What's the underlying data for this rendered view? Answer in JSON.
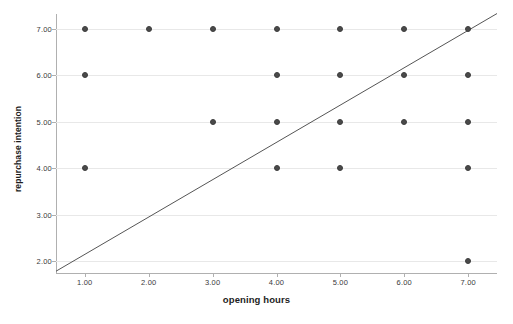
{
  "chart_data": {
    "type": "scatter",
    "title": "",
    "xlabel": "opening hours",
    "ylabel": "repurchase intention",
    "xlim": [
      0.55,
      7.45
    ],
    "ylim": [
      1.72,
      7.32
    ],
    "xticks": [
      1,
      2,
      3,
      4,
      5,
      6,
      7
    ],
    "xtick_labels": [
      "1.00",
      "2.00",
      "3.00",
      "4.00",
      "5.00",
      "6.00",
      "7.00"
    ],
    "yticks": [
      2,
      3,
      4,
      5,
      6,
      7
    ],
    "ytick_labels": [
      "2.00",
      "3.00",
      "4.00",
      "5.00",
      "6.00",
      "7.00"
    ],
    "grid": "horizontal",
    "legend": "none",
    "marker_color": "#4a4a4a",
    "line_color": "#555555",
    "gridline_color": "#e8e8e8",
    "axis_color": "#b0b0b0",
    "points": [
      {
        "x": 1,
        "y": 7
      },
      {
        "x": 1,
        "y": 6
      },
      {
        "x": 1,
        "y": 4
      },
      {
        "x": 2,
        "y": 7
      },
      {
        "x": 3,
        "y": 7
      },
      {
        "x": 3,
        "y": 5
      },
      {
        "x": 4,
        "y": 7
      },
      {
        "x": 4,
        "y": 6
      },
      {
        "x": 4,
        "y": 5
      },
      {
        "x": 4,
        "y": 4
      },
      {
        "x": 5,
        "y": 7
      },
      {
        "x": 5,
        "y": 6
      },
      {
        "x": 5,
        "y": 5
      },
      {
        "x": 5,
        "y": 4
      },
      {
        "x": 6,
        "y": 7
      },
      {
        "x": 6,
        "y": 6
      },
      {
        "x": 6,
        "y": 5
      },
      {
        "x": 7,
        "y": 7
      },
      {
        "x": 7,
        "y": 6
      },
      {
        "x": 7,
        "y": 5
      },
      {
        "x": 7,
        "y": 4
      },
      {
        "x": 7,
        "y": 2
      }
    ],
    "fit_line": {
      "label": "",
      "x_start": 0.55,
      "y_start": 1.78,
      "x_end": 7.45,
      "y_end": 7.33
    }
  }
}
